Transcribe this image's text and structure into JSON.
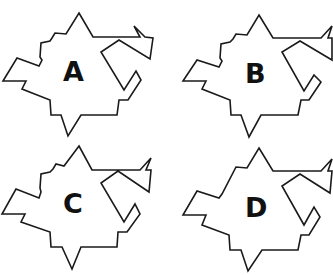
{
  "figure": {
    "stroke_color": "#1a1a1a",
    "options": [
      {
        "label": "A",
        "offset": [
          0,
          0
        ],
        "points": "79,13 93,37 140,37 134,26 145,37 153,38 150,59 119,40 101,52 124,90 136,71 141,80 128,100 119,100 117,115 81,115 68,136 61,115 51,115 50,100 22,89 26,81 3,81 17,58 39,66 42,60 40,57 41,43 50,41 52,38 55,33 66,34",
        "label_pos": [
          63,
          58
        ]
      },
      {
        "label": "B",
        "offset": [
          166,
          0
        ],
        "points": "93,15 107,38 155,38 166,26 162,38 166,38 166,60 134,41 116,52 138,91 148,75 155,82 143,100 135,100 132,115 95,115 83,137 75,115 65,115 64,100 36,89 40,81 17,81 31,60 53,67 56,61 54,58 55,44 64,42 67,39 70,34 81,35",
        "label_pos": [
          79,
          60
        ]
      },
      {
        "label": "C",
        "offset": [
          0,
          137
        ],
        "points": "79,9 92,33 140,33 151,21 146,33 151,33 149,55 118,34 101,46 124,85 135,67 140,77 127,95 118,95 117,110 81,110 72,132 62,110 51,110 50,95 21,85 25,77 2,77 16,52 39,61 41,55 40,51 41,37 50,35 53,32 56,27 64,29",
        "label_pos": [
          63,
          53
        ]
      },
      {
        "label": "D",
        "offset": [
          166,
          137
        ],
        "points": "93,11 107,34 155,34 166,22 162,34 166,34 164,56 134,37 116,49 138,88 148,70 154,80 143,98 135,98 132,113 96,113 82,134 75,113 64,113 63,98 36,88 40,78 17,78 31,54 53,61 56,57 70,30 81,31",
        "label_pos": [
          79,
          57
        ]
      }
    ]
  }
}
